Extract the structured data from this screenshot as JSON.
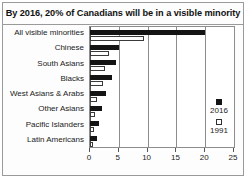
{
  "chart_data": {
    "type": "bar",
    "orientation": "horizontal",
    "title": "By 2016, 20% of Canadians will be in a visible minority",
    "xlabel": "",
    "ylabel": "",
    "xlim": [
      0,
      25
    ],
    "xticks": [
      0,
      5,
      10,
      15,
      20,
      25
    ],
    "xtick_labels": [
      "0",
      "5",
      "10",
      "15",
      "20",
      "25"
    ],
    "grid": true,
    "grid_axis": "x",
    "legend_position": "right",
    "categories": [
      "All visible minorities",
      "Chinese",
      "South Asians",
      "Blacks",
      "West Asians & Arabs",
      "Other Asians",
      "Pacific Islanders",
      "Latin Americans"
    ],
    "series": [
      {
        "name": "2016",
        "color": "#141414",
        "style": "filled",
        "values": [
          20.0,
          5.0,
          4.5,
          3.8,
          2.7,
          2.0,
          1.6,
          1.2
        ]
      },
      {
        "name": "1991",
        "color": "#ffffff",
        "style": "open",
        "values": [
          9.4,
          3.3,
          2.6,
          2.2,
          1.2,
          0.9,
          0.7,
          0.6
        ]
      }
    ]
  },
  "legend": {
    "entries": [
      {
        "label": "2016",
        "swatch": "filled-square"
      },
      {
        "label": "1991",
        "swatch": "open-square"
      }
    ]
  }
}
